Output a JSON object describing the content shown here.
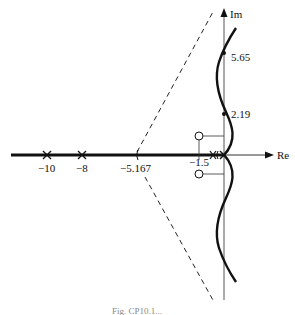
{
  "figure": {
    "type": "root-locus",
    "axes": {
      "real_label": "Re",
      "imag_label": "Im"
    },
    "poles": [
      {
        "label": "−10",
        "value": -10
      },
      {
        "label": "−8",
        "value": -8
      },
      {
        "label": "",
        "value": -0.5
      },
      {
        "label": "",
        "value": 0
      }
    ],
    "zeros": [
      {
        "label": "−1.5",
        "value": "-1.5 ± j"
      }
    ],
    "asymptote_centroid": {
      "label": "−5.167",
      "value": -5.167
    },
    "imag_crossings": [
      {
        "label": "5.65",
        "value": 5.65
      },
      {
        "label": "2.19",
        "value": 2.19
      }
    ],
    "caption": "Fig. CP10.1..."
  },
  "colors": {
    "line": "#111111",
    "axis": "#333333",
    "dashed": "#222222"
  }
}
